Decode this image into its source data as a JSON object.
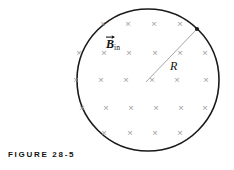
{
  "figure": {
    "caption": "FIGURE 28-5",
    "circle": {
      "cx": 148,
      "cy": 80,
      "r": 71,
      "stroke": "#1a1a1a",
      "stroke_width": 1.6,
      "fill": "#ffffff"
    },
    "field": {
      "symbol": "×",
      "meaning": "magnetic-field-into-page",
      "color": "#9b9b9b",
      "label_text": "B",
      "label_subscript": "in",
      "label_has_vector_arrow": true,
      "marks": [
        {
          "x": 103,
          "y": 24
        },
        {
          "x": 128,
          "y": 24
        },
        {
          "x": 154,
          "y": 24
        },
        {
          "x": 180,
          "y": 24
        },
        {
          "x": 79,
          "y": 53
        },
        {
          "x": 104,
          "y": 53
        },
        {
          "x": 129,
          "y": 53
        },
        {
          "x": 155,
          "y": 53
        },
        {
          "x": 180,
          "y": 53
        },
        {
          "x": 205,
          "y": 53
        },
        {
          "x": 76,
          "y": 80
        },
        {
          "x": 101,
          "y": 80
        },
        {
          "x": 126,
          "y": 80
        },
        {
          "x": 152,
          "y": 80
        },
        {
          "x": 177,
          "y": 80
        },
        {
          "x": 206,
          "y": 80
        },
        {
          "x": 82,
          "y": 108
        },
        {
          "x": 106,
          "y": 108
        },
        {
          "x": 131,
          "y": 108
        },
        {
          "x": 156,
          "y": 108
        },
        {
          "x": 181,
          "y": 108
        },
        {
          "x": 205,
          "y": 108
        },
        {
          "x": 104,
          "y": 133
        },
        {
          "x": 130,
          "y": 133
        },
        {
          "x": 155,
          "y": 133
        },
        {
          "x": 180,
          "y": 133
        }
      ]
    },
    "radius": {
      "label": "R",
      "line": {
        "x1": 146,
        "y1": 82,
        "x2": 196,
        "y2": 30
      },
      "color": "#9a9a9a",
      "stroke_width": 0.9,
      "endpoint_dot": {
        "cx": 197,
        "cy": 29,
        "r": 2.1,
        "color": "#1a1a1a"
      }
    }
  }
}
